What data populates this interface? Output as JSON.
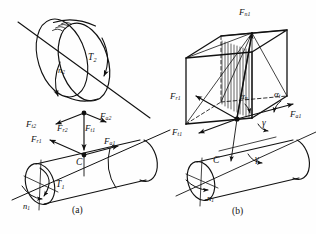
{
  "figure": {
    "background_color": "#fefefe",
    "stroke_color": "#111111",
    "width": 316,
    "height": 234,
    "panels": [
      {
        "id": "a",
        "caption": "(a)",
        "description": "Worm and worm wheel assembly with force components at meshing point C"
      },
      {
        "id": "b",
        "caption": "(b)",
        "description": "Force parallelepiped decomposition of normal force Fn1 at point C"
      }
    ]
  },
  "panel_a": {
    "caption": "(a)",
    "labels": {
      "torque_wheel": {
        "base": "T",
        "sub": "2"
      },
      "speed_wheel": {
        "base": "n",
        "sub": "2"
      },
      "torque_worm": {
        "base": "T",
        "sub": "1"
      },
      "speed_worm": {
        "base": "n",
        "sub": "1"
      },
      "center_point": "C",
      "force_t2": {
        "base": "F",
        "sub": "t2"
      },
      "force_r2": {
        "base": "F",
        "sub": "r2"
      },
      "force_a2": {
        "base": "F",
        "sub": "a2"
      },
      "force_t1": {
        "base": "F",
        "sub": "t1"
      },
      "force_r1": {
        "base": "F",
        "sub": "r1"
      },
      "force_a1": {
        "base": "F",
        "sub": "a1"
      }
    }
  },
  "panel_b": {
    "caption": "(b)",
    "labels": {
      "normal_force": {
        "base": "F",
        "sub": "n1"
      },
      "force_r1": {
        "base": "F",
        "sub": "r1"
      },
      "force_t1": {
        "base": "F",
        "sub": "t1"
      },
      "force_a1": {
        "base": "F",
        "sub": "a1"
      },
      "angle_alpha_n": {
        "base": "α",
        "sub": "n"
      },
      "angle_alpha_t": {
        "base": "α",
        "sub": "t"
      },
      "angle_gamma_upper": {
        "base": "γ",
        "sub": ""
      },
      "angle_gamma_lower": {
        "base": "γ",
        "sub": ""
      },
      "center_point": "C",
      "speed_worm": {
        "base": "n",
        "sub": "1"
      }
    }
  }
}
